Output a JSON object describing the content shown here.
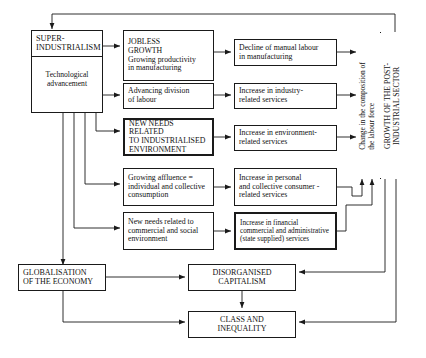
{
  "diagram": {
    "nodes": {
      "super_industrialism": {
        "heading": "SUPER-\nINDUSTRIALISM",
        "heading_line1": "SUPER-",
        "heading_line2": "INDUSTRIALISM",
        "body_line1": "Technological",
        "body_line2": "advancement"
      },
      "jobless_growth": {
        "line1": "JOBLESS",
        "line2": "GROWTH",
        "line3": "Growing productivity",
        "line4": "in manufacturing"
      },
      "advancing_division": {
        "line1": "Advancing division",
        "line2": "of labour"
      },
      "new_needs_industrialised": {
        "line1": "NEW NEEDS RELATED",
        "line2": "TO INDUSTRIALISED",
        "line3": "ENVIRONMENT"
      },
      "growing_affluence": {
        "line1": "Growing affluence =",
        "line2": "individual and collective",
        "line3": "consumption"
      },
      "new_needs_commercial": {
        "line1": "New needs related to",
        "line2": "commercial and social",
        "line3": "environment"
      },
      "decline_manual": {
        "line1": "Decline of manual labour",
        "line2": "in manufacturing"
      },
      "industry_services": {
        "line1": "Increase in industry-",
        "line2": "related services"
      },
      "environment_services": {
        "line1": "Increase in environment-",
        "line2": "related services"
      },
      "consumer_services": {
        "line1": "Increase in personal",
        "line2": "and collective consumer -",
        "line3": "related services"
      },
      "financial_services": {
        "line1": "Increase in financial",
        "line2": "commercial and administrative",
        "line3": "(state supplied) services"
      },
      "change_composition": {
        "line1": "Change in the composition of",
        "line2": "the labour force"
      },
      "growth_post_industrial": {
        "line1": "GROWTH OF THE POST-",
        "line2": "INDUSTRIAL SECTOR"
      },
      "globalisation": {
        "line1": "GLOBALISATION",
        "line2": "OF THE ECONOMY"
      },
      "disorganised_capitalism": {
        "line1": "DISORGANISED",
        "line2": "CAPITALISM"
      },
      "class_inequality": {
        "line1": "CLASS AND",
        "line2": "INEQUALITY"
      }
    },
    "colors": {
      "stroke": "#1a1a1a",
      "background": "#ffffff",
      "text": "#111111"
    }
  }
}
